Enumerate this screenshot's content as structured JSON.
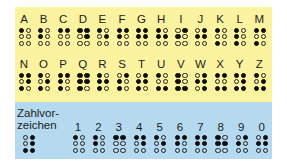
{
  "chart_data": {
    "type": "table",
    "dot_order": "dots 1,2,3 = left column top to bottom; dots 4,5,6 = right column top to bottom",
    "letters_row1": [
      {
        "label": "A",
        "dots": [
          1
        ]
      },
      {
        "label": "B",
        "dots": [
          1,
          2
        ]
      },
      {
        "label": "C",
        "dots": [
          1,
          4
        ]
      },
      {
        "label": "D",
        "dots": [
          1,
          4,
          5
        ]
      },
      {
        "label": "E",
        "dots": [
          1,
          5
        ]
      },
      {
        "label": "F",
        "dots": [
          1,
          2,
          4
        ]
      },
      {
        "label": "G",
        "dots": [
          1,
          2,
          4,
          5
        ]
      },
      {
        "label": "H",
        "dots": [
          1,
          2,
          5
        ]
      },
      {
        "label": "I",
        "dots": [
          2,
          4
        ]
      },
      {
        "label": "J",
        "dots": [
          2,
          4,
          5
        ]
      },
      {
        "label": "K",
        "dots": [
          1,
          3
        ]
      },
      {
        "label": "L",
        "dots": [
          1,
          2,
          3
        ]
      },
      {
        "label": "M",
        "dots": [
          1,
          3,
          4
        ]
      }
    ],
    "letters_row2": [
      {
        "label": "N",
        "dots": [
          1,
          3,
          4,
          5
        ]
      },
      {
        "label": "O",
        "dots": [
          1,
          3,
          5
        ]
      },
      {
        "label": "P",
        "dots": [
          1,
          2,
          3,
          4
        ]
      },
      {
        "label": "Q",
        "dots": [
          1,
          2,
          3,
          4,
          5
        ]
      },
      {
        "label": "R",
        "dots": [
          1,
          2,
          3,
          5
        ]
      },
      {
        "label": "S",
        "dots": [
          2,
          3,
          4
        ]
      },
      {
        "label": "T",
        "dots": [
          2,
          3,
          4,
          5
        ]
      },
      {
        "label": "U",
        "dots": [
          1,
          3,
          6
        ]
      },
      {
        "label": "V",
        "dots": [
          1,
          2,
          3,
          6
        ]
      },
      {
        "label": "W",
        "dots": [
          2,
          4,
          5,
          6
        ]
      },
      {
        "label": "X",
        "dots": [
          1,
          3,
          4,
          6
        ]
      },
      {
        "label": "Y",
        "dots": [
          1,
          3,
          4,
          5,
          6
        ]
      },
      {
        "label": "Z",
        "dots": [
          1,
          3,
          5,
          6
        ]
      }
    ],
    "number_sign": {
      "label_line1": "Zahlvor-",
      "label_line2": "zeichen",
      "dots": [
        3,
        4,
        5,
        6
      ]
    },
    "numbers": [
      {
        "label": "1",
        "dots": [
          1
        ]
      },
      {
        "label": "2",
        "dots": [
          1,
          2
        ]
      },
      {
        "label": "3",
        "dots": [
          1,
          4
        ]
      },
      {
        "label": "4",
        "dots": [
          1,
          4,
          5
        ]
      },
      {
        "label": "5",
        "dots": [
          1,
          5
        ]
      },
      {
        "label": "6",
        "dots": [
          1,
          2,
          4
        ]
      },
      {
        "label": "7",
        "dots": [
          1,
          2,
          4,
          5
        ]
      },
      {
        "label": "8",
        "dots": [
          1,
          2,
          5
        ]
      },
      {
        "label": "9",
        "dots": [
          2,
          4
        ]
      },
      {
        "label": "0",
        "dots": [
          2,
          4,
          5
        ]
      }
    ],
    "colors": {
      "letters_background": "#fbf3a0",
      "numbers_background": "#b5daf0",
      "dot_filled": "#0e0e0e"
    }
  }
}
